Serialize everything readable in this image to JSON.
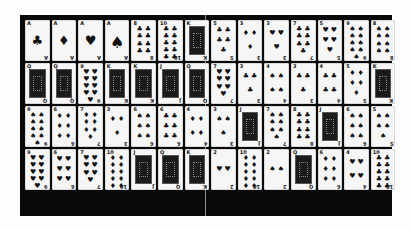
{
  "game": {
    "type": "card-grid",
    "rows": 4,
    "columns": 14,
    "colors": {
      "board": "#0a0a0a",
      "card": "#f6f6f6",
      "ink": "#111111",
      "background": "#fdfdfd"
    }
  },
  "cards": [
    [
      {
        "rank": "A",
        "suit": "♣"
      },
      {
        "rank": "A",
        "suit": "♦"
      },
      {
        "rank": "A",
        "suit": "♥"
      },
      {
        "rank": "A",
        "suit": "♠"
      },
      {
        "rank": "8",
        "suit": "♣"
      },
      {
        "rank": "10",
        "suit": "♣"
      },
      {
        "rank": "K",
        "suit": "♣",
        "face": true
      },
      {
        "rank": "5",
        "suit": "♣"
      },
      {
        "rank": "3",
        "suit": "♦"
      },
      {
        "rank": "3",
        "suit": "♥"
      },
      {
        "rank": "7",
        "suit": "♣"
      },
      {
        "rank": "5",
        "suit": "♥"
      },
      {
        "rank": "9",
        "suit": "♠"
      },
      {
        "rank": "8",
        "suit": "♠"
      }
    ],
    [
      {
        "rank": "Q",
        "suit": "♠",
        "face": true
      },
      {
        "rank": "Q",
        "suit": "♣",
        "face": true
      },
      {
        "rank": "9",
        "suit": "♥"
      },
      {
        "rank": "K",
        "suit": "♠",
        "face": true
      },
      {
        "rank": "K",
        "suit": "♦",
        "face": true
      },
      {
        "rank": "J",
        "suit": "♠",
        "face": true
      },
      {
        "rank": "Q",
        "suit": "♥",
        "face": true
      },
      {
        "rank": "7",
        "suit": "♥"
      },
      {
        "rank": "3",
        "suit": "♣"
      },
      {
        "rank": "4",
        "suit": "♠"
      },
      {
        "rank": "3",
        "suit": "♣"
      },
      {
        "rank": "4",
        "suit": "♣"
      },
      {
        "rank": "5",
        "suit": "♦"
      },
      {
        "rank": "K",
        "suit": "♥",
        "face": true
      }
    ],
    [
      {
        "rank": "9",
        "suit": "♠"
      },
      {
        "rank": "6",
        "suit": "♦"
      },
      {
        "rank": "7",
        "suit": "♦"
      },
      {
        "rank": "3",
        "suit": "♦"
      },
      {
        "rank": "6",
        "suit": "♠"
      },
      {
        "rank": "6",
        "suit": "♣"
      },
      {
        "rank": "4",
        "suit": "♦"
      },
      {
        "rank": "3",
        "suit": "♠"
      },
      {
        "rank": "J",
        "suit": "♦",
        "face": true
      },
      {
        "rank": "7",
        "suit": "♠"
      },
      {
        "rank": "8",
        "suit": "♣"
      },
      {
        "rank": "J",
        "suit": "♥",
        "face": true
      },
      {
        "rank": "6",
        "suit": "♠"
      },
      {
        "rank": "5",
        "suit": "♠"
      }
    ],
    [
      {
        "rank": "9",
        "suit": "♥"
      },
      {
        "rank": "6",
        "suit": "♥"
      },
      {
        "rank": "7",
        "suit": "♥"
      },
      {
        "rank": "10",
        "suit": "♦"
      },
      {
        "rank": "J",
        "suit": "♣",
        "face": true
      },
      {
        "rank": "Q",
        "suit": "♦",
        "face": true
      },
      {
        "rank": "K",
        "suit": "♣",
        "face": true
      },
      {
        "rank": "2",
        "suit": "♥"
      },
      {
        "rank": "10",
        "suit": "♦"
      },
      {
        "rank": "2",
        "suit": "♠"
      },
      {
        "rank": "Q",
        "suit": "♠",
        "face": true
      },
      {
        "rank": "6",
        "suit": "♦"
      },
      {
        "rank": "4",
        "suit": "♥"
      },
      {
        "rank": "10",
        "suit": "♣"
      }
    ]
  ]
}
